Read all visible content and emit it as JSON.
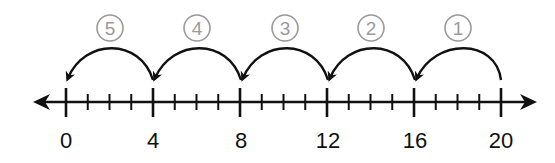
{
  "diagram": {
    "type": "number-line-skip-counting-backwards",
    "axis": {
      "min": 0,
      "max": 20,
      "major_step": 4,
      "minor_step": 1
    },
    "major_labels": [
      "0",
      "4",
      "8",
      "12",
      "16",
      "20"
    ],
    "jumps": [
      {
        "step": "①",
        "from": 20,
        "to": 16
      },
      {
        "step": "②",
        "from": 16,
        "to": 12
      },
      {
        "step": "③",
        "from": 12,
        "to": 8
      },
      {
        "step": "④",
        "from": 8,
        "to": 4
      },
      {
        "step": "⑤",
        "from": 4,
        "to": 0
      }
    ],
    "colors": {
      "line": "#111111",
      "step_label": "#9a9a9a"
    }
  }
}
